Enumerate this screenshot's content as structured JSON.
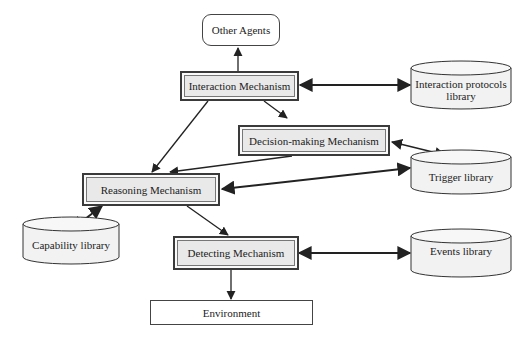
{
  "diagram": {
    "nodes": {
      "other_agents": {
        "label": "Other Agents"
      },
      "interaction": {
        "label": "Interaction Mechanism"
      },
      "interaction_lib": {
        "label": "Interaction protocols library"
      },
      "decision": {
        "label": "Decision-making Mechanism"
      },
      "trigger_lib": {
        "label": "Trigger library"
      },
      "reasoning": {
        "label": "Reasoning Mechanism"
      },
      "capability_lib": {
        "label": "Capability library"
      },
      "detecting": {
        "label": "Detecting Mechanism"
      },
      "events_lib": {
        "label": "Events library"
      },
      "environment": {
        "label": "Environment"
      }
    },
    "edges": [
      {
        "from": "interaction",
        "to": "other_agents",
        "type": "directed"
      },
      {
        "from": "interaction",
        "to": "interaction_lib",
        "type": "bidirectional"
      },
      {
        "from": "interaction",
        "to": "reasoning",
        "type": "directed"
      },
      {
        "from": "interaction",
        "to": "decision",
        "type": "directed"
      },
      {
        "from": "trigger_lib",
        "to": "decision",
        "type": "bidirectional"
      },
      {
        "from": "decision",
        "to": "reasoning",
        "type": "directed"
      },
      {
        "from": "reasoning",
        "to": "trigger_lib",
        "type": "bidirectional"
      },
      {
        "from": "reasoning",
        "to": "capability_lib",
        "type": "bidirectional"
      },
      {
        "from": "reasoning",
        "to": "detecting",
        "type": "directed"
      },
      {
        "from": "detecting",
        "to": "events_lib",
        "type": "bidirectional"
      },
      {
        "from": "detecting",
        "to": "environment",
        "type": "directed"
      }
    ]
  }
}
